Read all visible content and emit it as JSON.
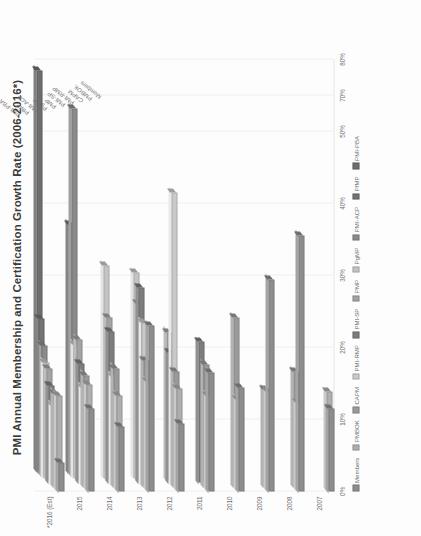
{
  "chart_data": {
    "type": "bar",
    "title": "PMI Annual Membership and Certification Growth Rate (2006-2016*)",
    "orientation": "horizontal-3d",
    "xlabel": "",
    "ylabel": "",
    "xlim": [
      0,
      0.6
    ],
    "grid": true,
    "legend_position": "bottom",
    "xtick_labels": [
      "0%",
      "10%",
      "20%",
      "30%",
      "40%",
      "50%",
      "70%",
      "80%"
    ],
    "xtick_values": [
      0,
      0.1,
      0.2,
      0.3,
      0.4,
      0.5,
      0.55,
      0.6
    ],
    "categories": [
      "2007",
      "2008",
      "2009",
      "2010",
      "2011",
      "2012",
      "2013",
      "2014",
      "2015",
      "*2016 (Est)"
    ],
    "series": [
      {
        "name": "Members",
        "color": "#8d8d8d",
        "values": [
          0.115,
          0.355,
          0.295,
          0.145,
          0.165,
          0.095,
          0.23,
          0.09,
          0.115,
          0.04
        ]
      },
      {
        "name": "PMBOK",
        "color": "#aeaeae",
        "values": [
          0.135,
          0.12,
          0.135,
          0.125,
          0.13,
          0.14,
          0.15,
          0.13,
          0.145,
          0.13
        ]
      },
      {
        "name": "CAPM",
        "color": "#9a9a9a",
        "values": [
          0.0,
          0.16,
          0.135,
          0.235,
          0.17,
          0.16,
          0.175,
          0.165,
          0.155,
          0.13
        ]
      },
      {
        "name": "PMI-RMP",
        "color": "#c9c9c9",
        "values": [
          0.0,
          0.0,
          0.0,
          0.0,
          0.0,
          0.405,
          0.225,
          0.15,
          0.135,
          0.11
        ]
      },
      {
        "name": "PMI-SP",
        "color": "#7d7d7d",
        "values": [
          0.0,
          0.0,
          0.0,
          0.0,
          0.195,
          0.18,
          0.27,
          0.21,
          0.165,
          0.135
        ]
      },
      {
        "name": "PMP",
        "color": "#a3a3a3",
        "values": [
          0.0,
          0.0,
          0.0,
          0.0,
          0.0,
          0.205,
          0.245,
          0.225,
          0.195,
          0.155
        ]
      },
      {
        "name": "PgMP",
        "color": "#c4c4c4",
        "values": [
          0.0,
          0.0,
          0.0,
          0.0,
          0.0,
          0.0,
          0.285,
          0.295,
          0.185,
          0.16
        ]
      },
      {
        "name": "PMI-ACP",
        "color": "#8a8a8a",
        "values": [
          0.0,
          0.0,
          0.0,
          0.0,
          0.0,
          0.0,
          0.0,
          0.0,
          0.51,
          0.18
        ]
      },
      {
        "name": "PfMP",
        "color": "#737373",
        "values": [
          0.0,
          0.0,
          0.0,
          0.0,
          0.0,
          0.0,
          0.0,
          0.0,
          0.345,
          0.215
        ]
      },
      {
        "name": "PMI-PBA",
        "color": "#6e6e6e",
        "values": [
          0.0,
          0.0,
          0.0,
          0.0,
          0.0,
          0.0,
          0.0,
          0.0,
          0.0,
          0.555
        ]
      }
    ],
    "series_callouts": [
      "PMI-PBA",
      "PfMP",
      "PMI-ACP",
      "PgMP",
      "PMP",
      "PMI-SP",
      "PMI-RMP",
      "CAPM",
      "PMBOK",
      "Members"
    ],
    "legend_entries": [
      "Members",
      "PMBOK",
      "CAPM",
      "PMI-RMP",
      "PMI-SP",
      "PMP",
      "PgMP",
      "PMI-ACP",
      "PfMP",
      "PMI-PBA"
    ]
  }
}
